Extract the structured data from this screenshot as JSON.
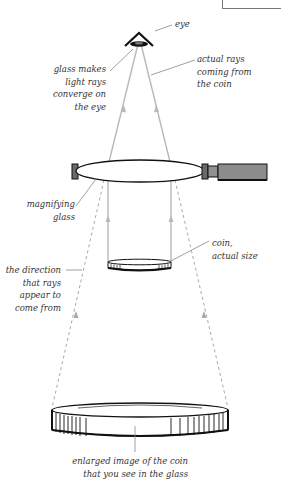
{
  "diagram": {
    "labels": {
      "eye": "eye",
      "converge": "glass makes\nlight rays\nconverge on\nthe eye",
      "actual_rays": "actual rays\ncoming from\nthe coin",
      "magnifying_glass": "magnifying\nglass",
      "coin": "coin,\nactual size",
      "direction": "the direction\nthat rays\nappear to\ncome from",
      "enlarged": "enlarged image of the coin\nthat you see in the glass"
    },
    "colors": {
      "outline": "#111111",
      "ray": "#b8b8b8",
      "dashed_ray": "#a8a8a8",
      "handle": "#8c8c8c",
      "leader": "#888888"
    }
  }
}
